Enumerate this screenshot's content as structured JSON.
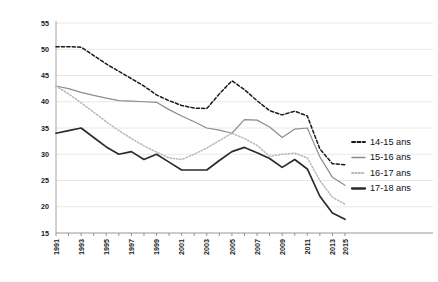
{
  "chart_data": {
    "type": "line",
    "title": "",
    "subtitle": "",
    "xlabel": "",
    "ylabel": "",
    "ylim": [
      15,
      55
    ],
    "yticks": [
      15,
      20,
      25,
      30,
      35,
      40,
      45,
      50,
      55
    ],
    "grid": true,
    "legend_position": "right",
    "x": [
      1991,
      1992,
      1993,
      1994,
      1995,
      1996,
      1997,
      1998,
      1999,
      2000,
      2001,
      2002,
      2003,
      2004,
      2005,
      2006,
      2007,
      2008,
      2009,
      2010,
      2011,
      2012,
      2013,
      2014
    ],
    "xtick_labels": [
      "1991",
      "1993",
      "1995",
      "1997",
      "1999",
      "2001",
      "2003",
      "2005",
      "2007",
      "2009",
      "2011",
      "2013",
      "2015"
    ],
    "series": [
      {
        "name": "14-15 ans",
        "style": "dashed",
        "color": "#1a1a1a",
        "values": [
          50.5,
          50.5,
          50.4,
          48.8,
          47.2,
          45.8,
          44.4,
          43.0,
          41.3,
          40.2,
          39.3,
          38.8,
          38.7,
          41.5,
          44.0,
          42.3,
          40.2,
          38.3,
          37.5,
          38.2,
          37.3,
          31.0,
          28.2,
          28.0
        ]
      },
      {
        "name": "15-16 ans",
        "style": "solid",
        "color": "#8c8c8c",
        "values": [
          43.0,
          42.5,
          41.8,
          41.2,
          40.7,
          40.2,
          40.1,
          40.0,
          39.9,
          38.5,
          37.3,
          36.2,
          35.0,
          34.6,
          34.0,
          36.6,
          36.5,
          35.2,
          33.2,
          34.8,
          35.0,
          29.5,
          25.6,
          24.1
        ]
      },
      {
        "name": "16-17 ans",
        "style": "dotted",
        "color": "#b8b8b8",
        "values": [
          43.0,
          41.5,
          39.8,
          38.0,
          36.2,
          34.5,
          33.0,
          31.6,
          30.4,
          29.3,
          29.0,
          30.0,
          31.2,
          32.6,
          34.0,
          33.0,
          31.7,
          29.6,
          30.0,
          30.2,
          29.3,
          25.0,
          21.8,
          20.5
        ]
      },
      {
        "name": "17-18 ans",
        "style": "solid-bold",
        "color": "#2b2b2b",
        "values": [
          34.0,
          34.5,
          35.0,
          33.2,
          31.4,
          30.0,
          30.5,
          29.0,
          30.0,
          28.5,
          27.0,
          27.0,
          27.0,
          28.8,
          30.5,
          31.3,
          30.3,
          29.2,
          27.5,
          29.0,
          27.2,
          22.0,
          18.8,
          17.6
        ]
      }
    ]
  },
  "legend": {
    "items": [
      {
        "label": "14-15 ans"
      },
      {
        "label": "15-16 ans"
      },
      {
        "label": "16-17 ans"
      },
      {
        "label": "17-18 ans"
      }
    ]
  }
}
